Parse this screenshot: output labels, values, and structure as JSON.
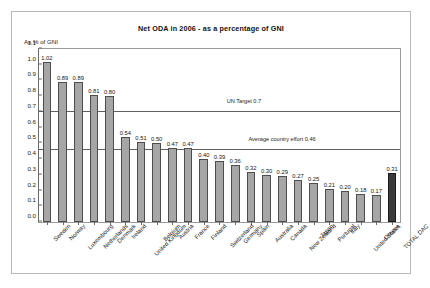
{
  "chart_data": {
    "type": "bar",
    "title": "Net ODA in 2006 - as a percentage of GNI",
    "xlabel": "",
    "ylabel": "As % of GNI",
    "ylim": [
      0.0,
      1.1
    ],
    "ytick_step": 0.1,
    "grid": false,
    "legend": "none",
    "categories": [
      "Sweden",
      "Norway",
      "Luxembourg",
      "Netherlands",
      "Denmark",
      "Ireland",
      "United Kingdom",
      "Belgium",
      "Austria",
      "France",
      "Finland",
      "Switzerland",
      "Germany",
      "Spain",
      "Australia",
      "Canada",
      "New Zealand",
      "Japan",
      "Portugal",
      "Italy",
      "United States",
      "Greece",
      "TOTAL DAC"
    ],
    "values": [
      1.02,
      0.89,
      0.89,
      0.81,
      0.8,
      0.54,
      0.51,
      0.5,
      0.47,
      0.47,
      0.4,
      0.39,
      0.36,
      0.32,
      0.3,
      0.29,
      0.27,
      0.25,
      0.21,
      0.2,
      0.18,
      0.17,
      0.31
    ],
    "value_labels": [
      "1.02",
      "0.89",
      "0.89",
      "0.81",
      "0.80",
      "0.54",
      "0.51",
      "0.50",
      "0.47",
      "0.47",
      "0.40",
      "0.39",
      "0.36",
      "0.32",
      "0.30",
      "0.29",
      "0.27",
      "0.25",
      "0.21",
      "0.20",
      "0.18",
      "0.17",
      "0.31"
    ],
    "highlight_index": 22,
    "ytick_labels": [
      "1.1",
      "1.0",
      "0.9",
      "0.8",
      "0.7",
      "0.6",
      "0.5",
      "0.4",
      "0.3",
      "0.2",
      "0.1",
      "0.0"
    ],
    "ytick_values": [
      1.1,
      1.0,
      0.9,
      0.8,
      0.7,
      0.6,
      0.5,
      0.4,
      0.3,
      0.2,
      0.1,
      0.0
    ],
    "annotations": [
      {
        "name": "un-target-line",
        "label": "UN Target 0.7",
        "value": 0.7,
        "label_x_pct": 52
      },
      {
        "name": "average-country-effort-line",
        "label": "Average country effort 0.46",
        "value": 0.46,
        "label_x_pct": 58
      }
    ],
    "colors": {
      "bar": "#a6a6a6",
      "bar_highlight": "#3a3a3a",
      "bar_border": "#4d4d4d",
      "reference_line": "#5f5f5f",
      "axis": "#6b6b6b",
      "background": "#ffffff",
      "text": "#151515"
    }
  }
}
